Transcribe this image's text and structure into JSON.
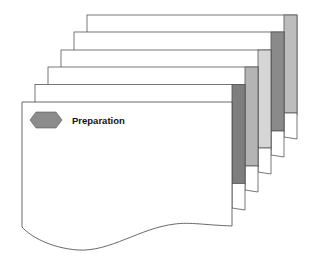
{
  "diagram": {
    "title_label": "Preparation",
    "badge_shape": "hexagon",
    "colors": {
      "line": "#444444",
      "badge_fill": "#8c8c8c",
      "page_fill": "#ffffff"
    },
    "stack": [
      {
        "index": 5,
        "tab_color": "#bdbdbd"
      },
      {
        "index": 4,
        "tab_color": "#8a8a8a"
      },
      {
        "index": 3,
        "tab_color": "#d6d6d6"
      },
      {
        "index": 2,
        "tab_color": "#b4b4b4"
      },
      {
        "index": 1,
        "tab_color": "#7e7e7e"
      }
    ]
  }
}
